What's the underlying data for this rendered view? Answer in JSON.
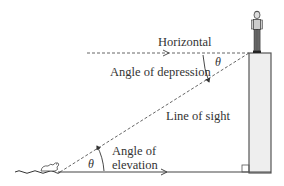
{
  "diagram": {
    "labels": {
      "horizontal": "Horizontal",
      "angle_of_depression": "Angle of depression",
      "line_of_sight": "Line of sight",
      "angle_of_elevation_line1": "Angle of",
      "angle_of_elevation_line2": "elevation",
      "theta_depression": "θ",
      "theta_elevation": "θ"
    },
    "elements": [
      "person on tower",
      "tower",
      "duck on water",
      "ground line",
      "horizontal line",
      "line of sight",
      "right-angle marker"
    ],
    "colors": {
      "line": "#444444",
      "tower_fill": "#eeeeee",
      "text": "#333333"
    }
  }
}
